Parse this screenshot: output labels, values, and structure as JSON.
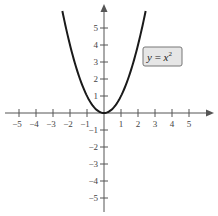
{
  "chart_data": {
    "type": "line",
    "title": "",
    "equation_label": "y = x²",
    "label_parts": {
      "lhs": "y",
      "eq": " = ",
      "var": "x",
      "exp": "2"
    },
    "xlabel": "",
    "ylabel": "",
    "xlim": [
      -5.5,
      6
    ],
    "ylim": [
      -5.5,
      6.2
    ],
    "x_ticks": [
      -5,
      -4,
      -3,
      -2,
      -1,
      1,
      2,
      3,
      4,
      5
    ],
    "y_ticks": [
      -5,
      -4,
      -3,
      -2,
      -1,
      1,
      2,
      3,
      4,
      5
    ],
    "series": [
      {
        "name": "y = x^2",
        "x": [
          -2.45,
          -2,
          -1.5,
          -1,
          -0.5,
          0,
          0.5,
          1,
          1.5,
          2,
          2.45
        ],
        "values": [
          6.0,
          4,
          2.25,
          1,
          0.25,
          0,
          0.25,
          1,
          2.25,
          4,
          6.0
        ]
      }
    ],
    "grid": false,
    "colors": {
      "curve": "#1a1a1a",
      "axis": "#555555",
      "label_box_fill": "#e6e6e6",
      "label_box_stroke": "#777777"
    }
  }
}
